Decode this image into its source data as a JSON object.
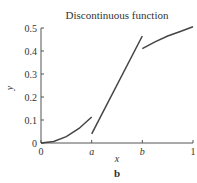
{
  "chart_data": {
    "type": "line",
    "title": "Discontinuous function",
    "subtitle": "",
    "xlabel": "x",
    "ylabel": "y",
    "panel_label": "b",
    "xlim": [
      0,
      1
    ],
    "ylim": [
      0,
      0.5
    ],
    "grid": false,
    "legend": null,
    "x_ticks": [
      {
        "value": 0,
        "label": "0"
      },
      {
        "value": 0.3333,
        "label": "a"
      },
      {
        "value": 0.6667,
        "label": "b"
      },
      {
        "value": 1,
        "label": "1"
      }
    ],
    "y_ticks": [
      {
        "value": 0,
        "label": "0"
      },
      {
        "value": 0.1,
        "label": "0.1"
      },
      {
        "value": 0.2,
        "label": "0.2"
      },
      {
        "value": 0.3,
        "label": "0.3"
      },
      {
        "value": 0.4,
        "label": "0.4"
      },
      {
        "value": 0.5,
        "label": "0.5"
      }
    ],
    "series": [
      {
        "name": "segment-1",
        "x": [
          0,
          0.0833,
          0.1667,
          0.25,
          0.3333
        ],
        "y": [
          0,
          0.007,
          0.028,
          0.063,
          0.113
        ]
      },
      {
        "name": "segment-2",
        "x": [
          0.3333,
          0.6667
        ],
        "y": [
          0.04,
          0.465
        ]
      },
      {
        "name": "segment-3",
        "x": [
          0.6667,
          0.75,
          0.8333,
          0.9167,
          1.0
        ],
        "y": [
          0.41,
          0.44,
          0.465,
          0.485,
          0.505
        ]
      }
    ],
    "line_color": "#444444"
  }
}
